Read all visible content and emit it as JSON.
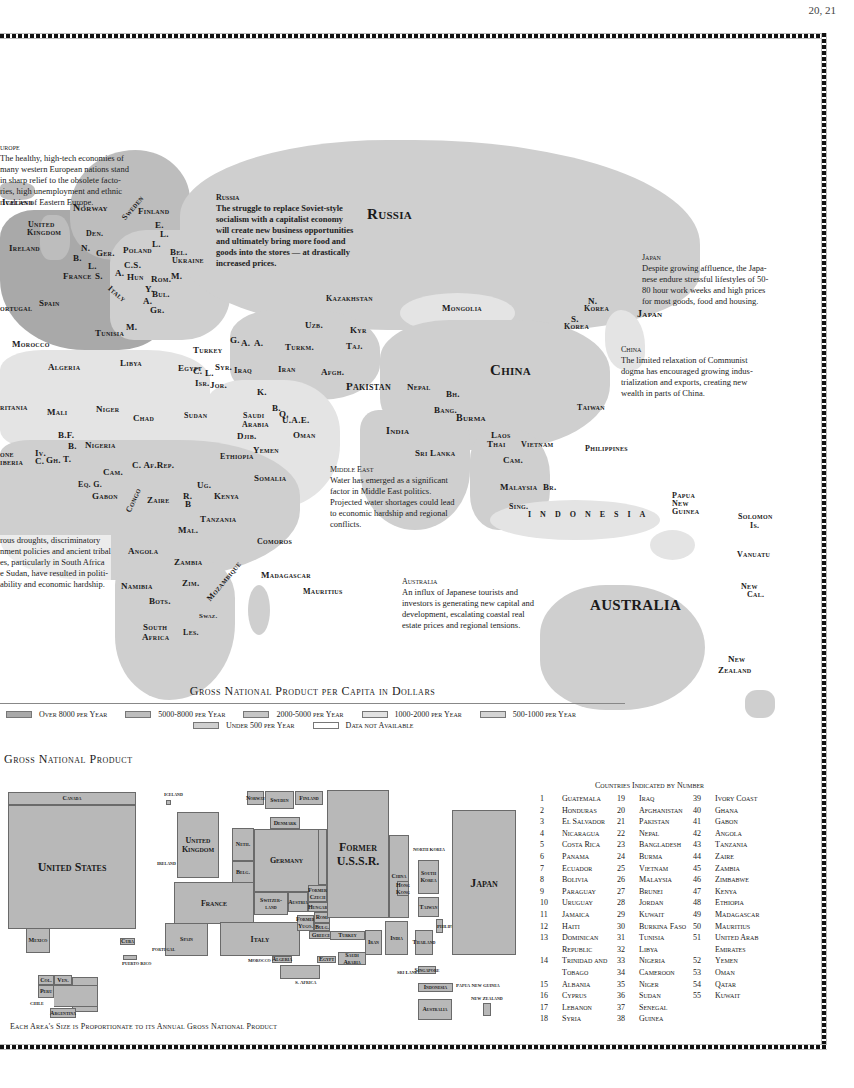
{
  "page_number": "20, 21",
  "map": {
    "notes": [
      {
        "id": "europe",
        "heading": "Europe",
        "text": "The healthy, high-tech economies of many western European nations stand in sharp relief to the obsolete factories, high unemployment and ethnic rivalries of Eastern Europe.",
        "lines": [
          "urope",
          "The healthy, high-tech economies of",
          "many western European nations stand",
          "in sharp relief to the obsolete facto-",
          "ries, high unemployment and ethnic",
          "rivalries of Eastern Europe."
        ]
      },
      {
        "id": "russia",
        "heading": "Russia",
        "lines": [
          "The struggle to replace Soviet-style",
          "socialism with a capitalist economy",
          "will create new business opportunities",
          "and ultimately bring more food and",
          "goods into the stores — at drastically",
          "increased prices."
        ]
      },
      {
        "id": "japan",
        "heading": "Japan",
        "lines": [
          "Despite growing affluence, the Japa-",
          "nese endure stressful lifestyles of 50-",
          "80 hour work weeks and high prices",
          "for most goods, food and housing."
        ]
      },
      {
        "id": "china",
        "heading": "China",
        "lines": [
          "The limited relaxation of Communist",
          "dogma has encouraged growing indus-",
          "trialization and exports, creating new",
          "wealth in parts of China."
        ]
      },
      {
        "id": "africa",
        "heading": "",
        "lines": [
          "rous droughts, discriminatory",
          "nment policies and ancient tribal",
          "es, particularly in South Africa",
          "e Sudan, have resulted in politi-",
          "ability and economic hardship."
        ]
      },
      {
        "id": "middle-east",
        "heading": "Middle East",
        "lines": [
          "Water has emerged as a significant",
          "factor in Middle East politics.",
          "Projected water shortages could lead",
          "to economic hardship and regional",
          "conflicts."
        ]
      },
      {
        "id": "australia",
        "heading": "Australia",
        "lines": [
          "An influx of Japanese tourists and",
          "investors is generating new capital and",
          "development, escalating coastal real",
          "estate prices and regional tensions."
        ]
      }
    ],
    "labels": {
      "iceland": "Iceland",
      "norway": "Norway",
      "sweden": "Sweden",
      "finland": "Finland",
      "uk1": "United",
      "uk2": "Kingdom",
      "ireland": "Ireland",
      "den": "Den.",
      "e": "E.",
      "l1": "L.",
      "l2": "L.",
      "n": "N.",
      "ger": "Ger.",
      "poland": "Poland",
      "bel": "Bel.",
      "ukraine": "Ukraine",
      "b": "B.",
      "l3": "L.",
      "cs": "C.S.",
      "france": "France",
      "s": "S.",
      "a": "A.",
      "hun": "Hun",
      "rom": "Rom.",
      "m": "M.",
      "italy": "Italy",
      "y": "Y.",
      "bul": "Bul.",
      "a2": "A.",
      "gr": "Gr.",
      "portugal": "ortugal",
      "spain": "Spain",
      "russia": "Russia",
      "kazakhstan": "Kazakhstan",
      "mongolia": "Mongolia",
      "uzb": "Uzb.",
      "kyr": "Kyr",
      "taj": "Taj.",
      "turkm": "Turkm.",
      "g": "G.",
      "a3": "A.",
      "a4": "A.",
      "turkey": "Turkey",
      "c": "C.",
      "l4": "L.",
      "syr": "Syr.",
      "isr": "Isr.",
      "jor": "Jor.",
      "iraq": "Iraq",
      "iran": "Iran",
      "afgh": "Afgh.",
      "k": "K.",
      "pakistan": "Pakistan",
      "nepal": "Nepal",
      "bh": "Bh.",
      "china": "China",
      "bang": "Bang.",
      "burma": "Burma",
      "india": "India",
      "b2": "B.",
      "q": "Q.",
      "uae": "U.A.E.",
      "saudi1": "Saudi",
      "saudi2": "Arabia",
      "oman": "Oman",
      "yemen": "Yemen",
      "nkorea1": "N.",
      "nkorea2": "Korea",
      "skorea1": "S.",
      "skorea2": "Korea",
      "japan": "Japan",
      "taiwan": "Taiwan",
      "tunisia": "Tunisia",
      "m2": "M.",
      "morocco": "Morocco",
      "algeria": "Algeria",
      "libya": "Libya",
      "egypt": "Egypt",
      "ritania": "ritania",
      "mali": "Mali",
      "niger": "Niger",
      "chad": "Chad",
      "sudan": "Sudan",
      "djib": "Djib.",
      "bf": "B.F.",
      "b3": "B.",
      "nigeria": "Nigeria",
      "ethiopia": "Ethiopia",
      "one": "one",
      "iberia": "iberia",
      "iv": "Iv.",
      "c2": "C.",
      "gh": "Gh.",
      "t": "T.",
      "cam": "Cam.",
      "car": "C. Af.Rep.",
      "somalia": "Somalia",
      "eqg": "Eq. G.",
      "gabon": "Gabon",
      "congo": "Congo",
      "zaire": "Zaire",
      "r": "R.",
      "b4": "B",
      "ug": "Ug.",
      "kenya": "Kenya",
      "tanzania": "Tanzania",
      "mal": "Mal.",
      "angola": "Angola",
      "zambia": "Zambia",
      "mozambique": "Mozambique",
      "namibia": "Namibia",
      "zim": "Zim.",
      "bots": "Bots.",
      "swaz": "Swaz.",
      "southafrica1": "South",
      "southafrica2": "Africa",
      "les": "Les.",
      "comoros": "Comoros",
      "madagascar": "Madagascar",
      "mauritius": "Mauritius",
      "srilanka": "Sri Lanka",
      "laos": "Laos",
      "thai": "Thai",
      "vietnam": "Vietnam",
      "cam2": "Cam.",
      "philippines": "Philippines",
      "malaysia": "Malaysia",
      "br": "Br.",
      "sing": "Sing.",
      "indonesia": "Indonesia",
      "png1": "Papua",
      "png2": "New",
      "png3": "Guinea",
      "solomon1": "Solomon",
      "solomon2": "Is.",
      "vanuatu": "Vanuatu",
      "newcal1": "New",
      "newcal2": "Cal.",
      "australia": "Australia",
      "nz1": "New",
      "nz2": "Zealand"
    }
  },
  "legend": {
    "title": "Gross National Product per Capita in Dollars",
    "items": [
      {
        "label": "Over 8000 per Year",
        "color": "#a9a9a9"
      },
      {
        "label": "5000-8000 per Year",
        "color": "#bdbdbd"
      },
      {
        "label": "2000-5000 per Year",
        "color": "#c6c6c6"
      },
      {
        "label": "1000-2000 per Year",
        "color": "#e2e2e2"
      },
      {
        "label": "500-1000 per Year",
        "color": "#d4d4d4"
      },
      {
        "label": "Under 500 per Year",
        "color": "#cfcfcf"
      },
      {
        "label": "Data not Available",
        "color": "#ffffff"
      }
    ]
  },
  "cartogram": {
    "title": "Gross National Product",
    "caption": "Each Area's Size is Proportionate to its Annual Gross National Product",
    "boxes": {
      "canada": "Canada",
      "us": "United States",
      "mexico": "Mexico",
      "cuba": "Cuba",
      "pr": "Puerto Rico",
      "col": "Col.",
      "ven": "Ven.",
      "peru": "Peru",
      "brazil": "Brazil",
      "chile": "Chile",
      "argentina": "Argentina",
      "iceland": "Iceland",
      "ireland": "Ireland",
      "uk": "United Kingdom",
      "neth": "Neth.",
      "belg": "Belg.",
      "lux": "Lux.",
      "france": "France",
      "spain": "Spain",
      "portugal": "Portugal",
      "italy": "Italy",
      "norway": "Norway",
      "sweden": "Sweden",
      "finland": "Finland",
      "denmark": "Denmark",
      "germany": "Germany",
      "poland": "Poland",
      "switzerland": "Switzer-land",
      "austria": "Austria",
      "czech": "Former Czech",
      "hungary": "Hungary",
      "yugo": "Former Yugo.",
      "rom": "Rom.",
      "bulg": "Bulg.",
      "greece": "Greece",
      "ussr": "Former U.S.S.R.",
      "turkey": "Turkey",
      "iran": "Iran",
      "israel": "Israel",
      "saudi": "Saudi Arabia",
      "egypt": "Egypt",
      "algeria": "Algeria",
      "morocco": "Morocco",
      "safrica": "S. Africa",
      "china": "China",
      "hongkong": "Hong Kong",
      "india": "India",
      "srilanka": "Sri Lanka",
      "nkorea": "North Korea",
      "skorea": "South Korea",
      "taiwan": "Taiwan",
      "thailand": "Thailand",
      "singapore": "Singapore",
      "philippines": "Philippines",
      "indonesia": "Indonesia",
      "png": "Papua New Guinea",
      "australia": "Australia",
      "nz": "New Zealand",
      "japan": "Japan"
    }
  },
  "index": {
    "title": "Countries Indicated by Number",
    "columns": [
      [
        {
          "n": "1",
          "name": "Guatemala"
        },
        {
          "n": "2",
          "name": "Honduras"
        },
        {
          "n": "3",
          "name": "El Salvador"
        },
        {
          "n": "4",
          "name": "Nicaragua"
        },
        {
          "n": "5",
          "name": "Costa Rica"
        },
        {
          "n": "6",
          "name": "Panama"
        },
        {
          "n": "7",
          "name": "Ecuador"
        },
        {
          "n": "8",
          "name": "Bolivia"
        },
        {
          "n": "9",
          "name": "Paraguay"
        },
        {
          "n": "10",
          "name": "Uruguay"
        },
        {
          "n": "11",
          "name": "Jamaica"
        },
        {
          "n": "12",
          "name": "Haiti"
        },
        {
          "n": "13",
          "name": "Dominican"
        },
        {
          "n": "",
          "name": "Republic"
        },
        {
          "n": "14",
          "name": "Trinidad and"
        },
        {
          "n": "",
          "name": "Tobago"
        },
        {
          "n": "15",
          "name": "Albania"
        },
        {
          "n": "16",
          "name": "Cyprus"
        },
        {
          "n": "17",
          "name": "Lebanon"
        },
        {
          "n": "18",
          "name": "Syria"
        }
      ],
      [
        {
          "n": "19",
          "name": "Iraq"
        },
        {
          "n": "20",
          "name": "Afghanistan"
        },
        {
          "n": "21",
          "name": "Pakistan"
        },
        {
          "n": "22",
          "name": "Nepal"
        },
        {
          "n": "23",
          "name": "Bangladesh"
        },
        {
          "n": "24",
          "name": "Burma"
        },
        {
          "n": "25",
          "name": "Vietnam"
        },
        {
          "n": "26",
          "name": "Malaysia"
        },
        {
          "n": "27",
          "name": "Brunei"
        },
        {
          "n": "28",
          "name": "Jordan"
        },
        {
          "n": "29",
          "name": "Kuwait"
        },
        {
          "n": "30",
          "name": "Burkina Faso"
        },
        {
          "n": "31",
          "name": "Tunisia"
        },
        {
          "n": "32",
          "name": "Libya"
        },
        {
          "n": "33",
          "name": "Nigeria"
        },
        {
          "n": "34",
          "name": "Cameroon"
        },
        {
          "n": "35",
          "name": "Niger"
        },
        {
          "n": "36",
          "name": "Sudan"
        },
        {
          "n": "37",
          "name": "Senegal"
        },
        {
          "n": "38",
          "name": "Guinea"
        }
      ],
      [
        {
          "n": "39",
          "name": "Ivory Coast"
        },
        {
          "n": "40",
          "name": "Ghana"
        },
        {
          "n": "41",
          "name": "Gabon"
        },
        {
          "n": "42",
          "name": "Angola"
        },
        {
          "n": "43",
          "name": "Tanzania"
        },
        {
          "n": "44",
          "name": "Zaire"
        },
        {
          "n": "45",
          "name": "Zambia"
        },
        {
          "n": "46",
          "name": "Zimbabwe"
        },
        {
          "n": "47",
          "name": "Kenya"
        },
        {
          "n": "48",
          "name": "Ethiopia"
        },
        {
          "n": "49",
          "name": "Madagascar"
        },
        {
          "n": "50",
          "name": "Mauritius"
        },
        {
          "n": "51",
          "name": "United Arab"
        },
        {
          "n": "",
          "name": "Emirates"
        },
        {
          "n": "52",
          "name": "Yemen"
        },
        {
          "n": "53",
          "name": "Oman"
        },
        {
          "n": "54",
          "name": "Qatar"
        },
        {
          "n": "55",
          "name": "Kuwait"
        }
      ]
    ]
  }
}
